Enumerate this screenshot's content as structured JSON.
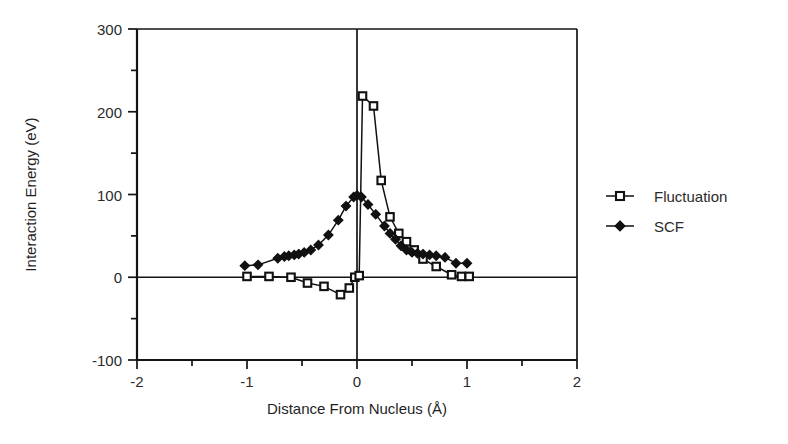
{
  "chart_data": {
    "type": "line",
    "title": "",
    "xlabel": "Distance From Nucleus (Å)",
    "ylabel": "Interaction Energy (eV)",
    "xlim": [
      -2,
      2
    ],
    "ylim": [
      -100,
      300
    ],
    "xticks": [
      -2,
      -1,
      0,
      1,
      2
    ],
    "xticklabels": [
      "-2",
      "-1",
      "0",
      "1",
      "2"
    ],
    "xminorticks": [
      -1.5,
      -0.5,
      0.5,
      1.5
    ],
    "yticks": [
      -100,
      0,
      100,
      200,
      300
    ],
    "yticklabels": [
      "-100",
      "0",
      "100",
      "200",
      "300"
    ],
    "yminorticks": [
      -50,
      50,
      150,
      250
    ],
    "grid": false,
    "legend_position": "right",
    "series": [
      {
        "name": "Fluctuation",
        "marker": "open-square",
        "points": [
          {
            "x": -1.0,
            "y": 1
          },
          {
            "x": -0.8,
            "y": 1
          },
          {
            "x": -0.6,
            "y": 0
          },
          {
            "x": -0.45,
            "y": -7
          },
          {
            "x": -0.3,
            "y": -11
          },
          {
            "x": -0.15,
            "y": -21
          },
          {
            "x": -0.07,
            "y": -13
          },
          {
            "x": -0.02,
            "y": 0
          },
          {
            "x": 0.02,
            "y": 2
          },
          {
            "x": 0.05,
            "y": 219
          },
          {
            "x": 0.15,
            "y": 207
          },
          {
            "x": 0.22,
            "y": 117
          },
          {
            "x": 0.3,
            "y": 73
          },
          {
            "x": 0.38,
            "y": 53
          },
          {
            "x": 0.45,
            "y": 43
          },
          {
            "x": 0.52,
            "y": 33
          },
          {
            "x": 0.6,
            "y": 22
          },
          {
            "x": 0.72,
            "y": 13
          },
          {
            "x": 0.86,
            "y": 3
          },
          {
            "x": 0.95,
            "y": 1
          },
          {
            "x": 1.02,
            "y": 1
          }
        ]
      },
      {
        "name": "SCF",
        "marker": "filled-diamond",
        "points": [
          {
            "x": -1.02,
            "y": 14
          },
          {
            "x": -0.9,
            "y": 15
          },
          {
            "x": -0.72,
            "y": 23
          },
          {
            "x": -0.66,
            "y": 25
          },
          {
            "x": -0.62,
            "y": 26
          },
          {
            "x": -0.57,
            "y": 27
          },
          {
            "x": -0.53,
            "y": 28
          },
          {
            "x": -0.48,
            "y": 30
          },
          {
            "x": -0.42,
            "y": 33
          },
          {
            "x": -0.35,
            "y": 39
          },
          {
            "x": -0.26,
            "y": 51
          },
          {
            "x": -0.17,
            "y": 69
          },
          {
            "x": -0.1,
            "y": 86
          },
          {
            "x": -0.03,
            "y": 97
          },
          {
            "x": 0.0,
            "y": 99
          },
          {
            "x": 0.04,
            "y": 97
          },
          {
            "x": 0.1,
            "y": 88
          },
          {
            "x": 0.17,
            "y": 76
          },
          {
            "x": 0.25,
            "y": 62
          },
          {
            "x": 0.3,
            "y": 53
          },
          {
            "x": 0.35,
            "y": 46
          },
          {
            "x": 0.4,
            "y": 38
          },
          {
            "x": 0.45,
            "y": 33
          },
          {
            "x": 0.5,
            "y": 30
          },
          {
            "x": 0.55,
            "y": 29
          },
          {
            "x": 0.6,
            "y": 28
          },
          {
            "x": 0.66,
            "y": 27
          },
          {
            "x": 0.72,
            "y": 26
          },
          {
            "x": 0.8,
            "y": 24
          },
          {
            "x": 0.9,
            "y": 17
          },
          {
            "x": 1.0,
            "y": 17
          }
        ]
      }
    ]
  },
  "legend": {
    "items": [
      {
        "label": "Fluctuation",
        "marker": "open-square"
      },
      {
        "label": "SCF",
        "marker": "filled-diamond"
      }
    ]
  }
}
